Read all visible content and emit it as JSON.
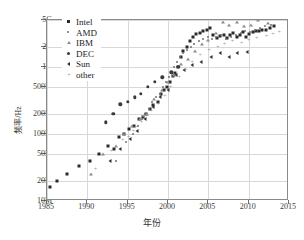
{
  "chart_data": {
    "type": "scatter",
    "title": "",
    "xlabel": "年份",
    "ylabel": "频率/Hz",
    "xlim": [
      1985,
      2015
    ],
    "ylim_label": [
      "10M",
      "5G"
    ],
    "yscale": "log",
    "grid": true,
    "legend_position": "upper-left-inside",
    "x_ticks": [
      "1985",
      "1990",
      "1995",
      "2000",
      "2005",
      "2010",
      "2015"
    ],
    "x_tick_values": [
      1985,
      1990,
      1995,
      2000,
      2005,
      2010,
      2015
    ],
    "y_ticks": [
      "10M",
      "20M",
      "50M",
      "100M",
      "200M",
      "500M",
      "1G",
      "2G",
      "5G"
    ],
    "y_tick_values": [
      10000000,
      20000000,
      50000000,
      100000000,
      200000000,
      500000000,
      1000000000,
      2000000000,
      5000000000
    ],
    "series": [
      {
        "name": "Intel",
        "marker": "m-square",
        "color": "#2a2a2a",
        "points": [
          [
            1985.4,
            16000000
          ],
          [
            1986.2,
            20000000
          ],
          [
            1987.5,
            25000000
          ],
          [
            1989.0,
            33000000
          ],
          [
            1990.3,
            40000000
          ],
          [
            1991.4,
            50000000
          ],
          [
            1992.5,
            66000000
          ],
          [
            1993.3,
            60000000
          ],
          [
            1993.9,
            90000000
          ],
          [
            1994.6,
            100000000
          ],
          [
            1995.2,
            120000000
          ],
          [
            1995.8,
            133000000
          ],
          [
            1996.4,
            166000000
          ],
          [
            1996.9,
            180000000
          ],
          [
            1997.3,
            200000000
          ],
          [
            1997.8,
            233000000
          ],
          [
            1998.2,
            266000000
          ],
          [
            1998.7,
            300000000
          ],
          [
            1999.1,
            400000000
          ],
          [
            1999.5,
            450000000
          ],
          [
            1999.9,
            500000000
          ],
          [
            2000.2,
            600000000
          ],
          [
            2000.6,
            733000000
          ],
          [
            2000.9,
            800000000
          ],
          [
            2001.2,
            1000000000
          ],
          [
            2001.6,
            1400000000
          ],
          [
            2001.9,
            1700000000
          ],
          [
            2002.3,
            2000000000
          ],
          [
            2002.7,
            2400000000
          ],
          [
            2003.1,
            2800000000
          ],
          [
            2003.5,
            3060000000
          ],
          [
            2004.0,
            3200000000
          ],
          [
            2004.4,
            3400000000
          ],
          [
            2004.8,
            3600000000
          ],
          [
            2005.2,
            3800000000
          ],
          [
            2005.6,
            3000000000
          ],
          [
            2006.1,
            2660000000
          ],
          [
            2006.5,
            2930000000
          ],
          [
            2006.9,
            3000000000
          ],
          [
            2007.3,
            2660000000
          ],
          [
            2007.7,
            3000000000
          ],
          [
            2008.1,
            3200000000
          ],
          [
            2008.5,
            2800000000
          ],
          [
            2008.9,
            3000000000
          ],
          [
            2009.3,
            3330000000
          ],
          [
            2009.7,
            2800000000
          ],
          [
            2010.1,
            3060000000
          ],
          [
            2010.5,
            3330000000
          ],
          [
            2010.9,
            3460000000
          ],
          [
            2011.3,
            3400000000
          ],
          [
            2011.7,
            3500000000
          ],
          [
            2012.1,
            3600000000
          ],
          [
            2012.6,
            3800000000
          ],
          [
            2013.2,
            4000000000
          ]
        ]
      },
      {
        "name": "AMD",
        "marker": "m-dot",
        "color": "#6f6f6f",
        "points": [
          [
            1993.6,
            40000000
          ],
          [
            1994.8,
            75000000
          ],
          [
            1995.6,
            100000000
          ],
          [
            1996.3,
            133000000
          ],
          [
            1996.8,
            166000000
          ],
          [
            1997.2,
            200000000
          ],
          [
            1997.6,
            233000000
          ],
          [
            1998.0,
            300000000
          ],
          [
            1998.5,
            350000000
          ],
          [
            1999.0,
            400000000
          ],
          [
            1999.4,
            500000000
          ],
          [
            1999.8,
            600000000
          ],
          [
            2000.1,
            700000000
          ],
          [
            2000.5,
            800000000
          ],
          [
            2000.8,
            1000000000
          ],
          [
            2001.1,
            1200000000
          ],
          [
            2001.5,
            1400000000
          ],
          [
            2001.9,
            1600000000
          ],
          [
            2002.4,
            1800000000
          ],
          [
            2002.8,
            2000000000
          ],
          [
            2003.2,
            2200000000
          ],
          [
            2003.8,
            2400000000
          ],
          [
            2004.3,
            2600000000
          ],
          [
            2004.9,
            2800000000
          ],
          [
            2005.4,
            2600000000
          ],
          [
            2006.0,
            2800000000
          ],
          [
            2006.6,
            3000000000
          ],
          [
            2007.2,
            2600000000
          ],
          [
            2007.8,
            2800000000
          ],
          [
            2008.4,
            3000000000
          ],
          [
            2009.0,
            3200000000
          ],
          [
            2009.6,
            3400000000
          ],
          [
            2010.2,
            3300000000
          ],
          [
            2010.8,
            3600000000
          ],
          [
            2011.4,
            3800000000
          ],
          [
            2012.0,
            4000000000
          ],
          [
            2012.8,
            4200000000
          ]
        ]
      },
      {
        "name": "IBM",
        "marker": "m-tri",
        "color": "#8c8c8c",
        "points": [
          [
            1990.5,
            25000000
          ],
          [
            1992.0,
            50000000
          ],
          [
            1993.5,
            66000000
          ],
          [
            1994.5,
            100000000
          ],
          [
            1995.5,
            133000000
          ],
          [
            1996.5,
            166000000
          ],
          [
            1997.4,
            200000000
          ],
          [
            1998.3,
            333000000
          ],
          [
            1999.2,
            450000000
          ],
          [
            2000.0,
            600000000
          ],
          [
            2000.8,
            750000000
          ],
          [
            2001.6,
            1100000000
          ],
          [
            2002.5,
            1300000000
          ],
          [
            2003.4,
            1700000000
          ],
          [
            2004.2,
            2200000000
          ],
          [
            2005.0,
            2500000000
          ],
          [
            2005.9,
            3200000000
          ],
          [
            2006.8,
            4700000000
          ],
          [
            2007.6,
            4200000000
          ],
          [
            2008.5,
            4700000000
          ],
          [
            2009.4,
            4000000000
          ],
          [
            2010.3,
            4250000000
          ],
          [
            2011.2,
            5000000000
          ],
          [
            2012.4,
            4500000000
          ]
        ]
      },
      {
        "name": "DEC",
        "marker": "m-circ",
        "color": "#3a3a3a",
        "points": [
          [
            1992.3,
            150000000
          ],
          [
            1993.2,
            200000000
          ],
          [
            1994.1,
            275000000
          ],
          [
            1995.0,
            300000000
          ],
          [
            1995.9,
            350000000
          ],
          [
            1996.6,
            400000000
          ],
          [
            1997.5,
            500000000
          ],
          [
            1998.4,
            600000000
          ],
          [
            1999.3,
            700000000
          ],
          [
            2000.4,
            833000000
          ],
          [
            2001.3,
            1000000000
          ]
        ]
      },
      {
        "name": "Sun",
        "marker": "m-ltri",
        "color": "#2f2f2f",
        "points": [
          [
            1992.8,
            40000000
          ],
          [
            1994.0,
            60000000
          ],
          [
            1995.3,
            85000000
          ],
          [
            1996.2,
            110000000
          ],
          [
            1997.1,
            167000000
          ],
          [
            1998.1,
            250000000
          ],
          [
            1999.0,
            360000000
          ],
          [
            2000.0,
            450000000
          ],
          [
            2001.0,
            750000000
          ],
          [
            2002.0,
            900000000
          ],
          [
            2003.0,
            1050000000
          ],
          [
            2004.1,
            1200000000
          ],
          [
            2005.3,
            1400000000
          ],
          [
            2006.4,
            1600000000
          ],
          [
            2007.5,
            1400000000
          ],
          [
            2008.6,
            1600000000
          ],
          [
            2009.8,
            1650000000
          ]
        ]
      },
      {
        "name": "other",
        "marker": "m-plus",
        "color": "#9a9a9a",
        "points": [
          [
            1991.0,
            30000000
          ],
          [
            1993.0,
            55000000
          ],
          [
            1994.4,
            80000000
          ],
          [
            1995.1,
            90000000
          ],
          [
            1995.7,
            110000000
          ],
          [
            1996.0,
            125000000
          ],
          [
            1996.7,
            150000000
          ],
          [
            1997.0,
            180000000
          ],
          [
            1997.9,
            220000000
          ],
          [
            1998.8,
            280000000
          ],
          [
            1999.6,
            366000000
          ],
          [
            2000.3,
            500000000
          ],
          [
            2001.4,
            700000000
          ],
          [
            2002.2,
            900000000
          ],
          [
            2003.0,
            1200000000
          ],
          [
            2004.0,
            1500000000
          ],
          [
            2005.1,
            1800000000
          ],
          [
            2006.2,
            2000000000
          ],
          [
            2007.0,
            2200000000
          ],
          [
            2008.0,
            2400000000
          ],
          [
            2009.1,
            2300000000
          ],
          [
            2010.0,
            2500000000
          ],
          [
            2011.0,
            2700000000
          ],
          [
            2012.2,
            2900000000
          ],
          [
            2013.0,
            3100000000
          ],
          [
            2013.8,
            3300000000
          ]
        ]
      }
    ]
  },
  "legend": {
    "items": [
      {
        "label": "Intel",
        "marker": "m-square"
      },
      {
        "label": "AMD",
        "marker": "m-dot"
      },
      {
        "label": "IBM",
        "marker": "m-tri"
      },
      {
        "label": "DEC",
        "marker": "m-circ"
      },
      {
        "label": "Sun",
        "marker": "m-ltri"
      },
      {
        "label": "other",
        "marker": "m-plus"
      }
    ]
  },
  "axes": {
    "x_title": "年份",
    "y_title": "频率/Hz"
  }
}
